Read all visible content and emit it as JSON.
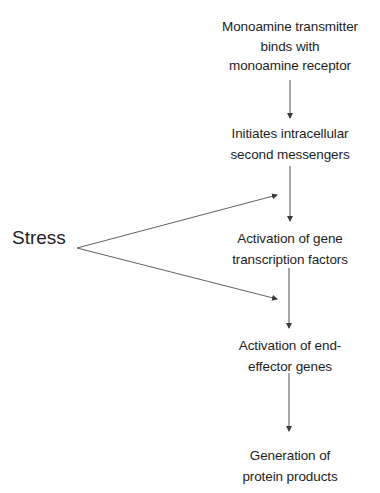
{
  "diagram": {
    "nodes": [
      {
        "id": "n1",
        "lines": [
          "Monoamine transmitter",
          "binds with",
          "monoamine receptor"
        ]
      },
      {
        "id": "n2",
        "lines": [
          "Initiates intracellular",
          "second messengers"
        ]
      },
      {
        "id": "n3",
        "lines": [
          "Activation of gene",
          "transcription factors"
        ]
      },
      {
        "id": "n4",
        "lines": [
          "Activation of end-",
          "effector genes"
        ]
      },
      {
        "id": "n5",
        "lines": [
          "Generation of",
          "protein products"
        ]
      }
    ],
    "stress": {
      "label": "Stress"
    },
    "edges": [
      {
        "from": "n1",
        "to": "n2"
      },
      {
        "from": "n2",
        "to": "n3"
      },
      {
        "from": "n3",
        "to": "n4"
      },
      {
        "from": "n4",
        "to": "n5"
      },
      {
        "from": "stress",
        "to": "edge n2->n3"
      },
      {
        "from": "stress",
        "to": "edge n3->n4"
      }
    ],
    "colors": {
      "text": "#1e1e1e",
      "line": "#3a3a3a"
    }
  }
}
